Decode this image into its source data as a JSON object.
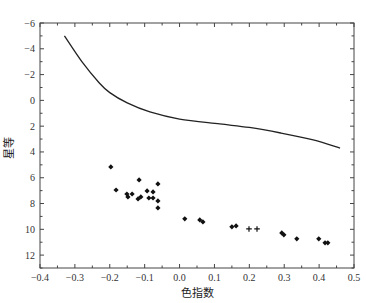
{
  "chart_data": {
    "type": "scatter",
    "title": "",
    "xlabel": "色指数",
    "ylabel": "星等",
    "xlim": [
      -0.4,
      0.5
    ],
    "ylim": [
      13,
      -6
    ],
    "y_inverted": true,
    "grid": false,
    "x_ticks": [
      -0.4,
      -0.3,
      -0.2,
      -0.1,
      0.0,
      0.1,
      0.2,
      0.3,
      0.4,
      0.5
    ],
    "x_tick_labels": [
      "-0.4",
      "-0.3",
      "-0.2",
      "-0.1",
      "0.0",
      "0.1",
      "0.2",
      "0.3",
      "0.4",
      "0.5"
    ],
    "y_ticks": [
      -6,
      -4,
      -2,
      0,
      2,
      4,
      6,
      8,
      10,
      12
    ],
    "y_tick_labels": [
      "-6",
      "-4",
      "-2",
      "0",
      "2",
      "4",
      "6",
      "8",
      "10",
      "12"
    ],
    "series": [
      {
        "name": "main-sequence-curve",
        "type": "line",
        "color": "#222222",
        "x": [
          -0.33,
          -0.28,
          -0.23,
          -0.2,
          -0.15,
          -0.085,
          0.0,
          0.115,
          0.2,
          0.29,
          0.38,
          0.46
        ],
        "y": [
          -5.0,
          -3.0,
          -1.35,
          -0.6,
          0.2,
          0.9,
          1.45,
          1.83,
          2.1,
          2.53,
          3.05,
          3.7
        ]
      },
      {
        "name": "cluster-stars",
        "type": "scatter",
        "marker": "diamond",
        "color": "#111111",
        "x": [
          -0.197,
          -0.182,
          -0.116,
          -0.062,
          -0.151,
          -0.136,
          -0.148,
          -0.119,
          -0.111,
          -0.093,
          -0.076,
          -0.088,
          -0.076,
          -0.062,
          -0.062,
          0.015,
          0.058,
          0.067,
          0.15,
          0.162,
          0.293,
          0.299,
          0.336,
          0.399,
          0.417,
          0.425
        ],
        "y": [
          5.16,
          6.95,
          6.17,
          6.48,
          7.26,
          7.26,
          7.49,
          7.64,
          7.49,
          7.02,
          7.1,
          7.57,
          7.57,
          7.8,
          8.34,
          9.19,
          9.27,
          9.43,
          9.81,
          9.74,
          10.28,
          10.43,
          10.74,
          10.74,
          11.05,
          11.05
        ]
      },
      {
        "name": "cluster-stars-cross",
        "type": "scatter",
        "marker": "plus",
        "color": "#111111",
        "x": [
          0.199,
          0.222
        ],
        "y": [
          9.97,
          9.97
        ]
      }
    ]
  }
}
